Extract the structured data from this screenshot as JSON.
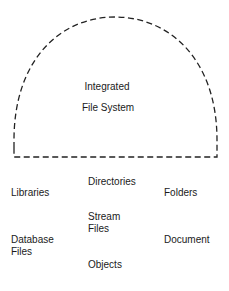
{
  "diagram": {
    "container": {
      "label_line1": "Integrated",
      "label_line2": "File System",
      "stroke": "#222222",
      "style": "dashed"
    },
    "items": [
      {
        "id": "libraries",
        "label": "Libraries"
      },
      {
        "id": "directories",
        "label": "Directories"
      },
      {
        "id": "folders",
        "label": "Folders"
      },
      {
        "id": "stream-files",
        "label": "Stream\nFiles"
      },
      {
        "id": "database-files",
        "label": "Database\nFiles"
      },
      {
        "id": "document",
        "label": "Document"
      },
      {
        "id": "objects",
        "label": "Objects"
      }
    ]
  }
}
